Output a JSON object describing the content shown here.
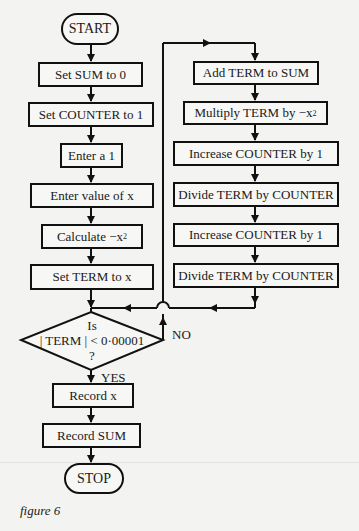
{
  "figure": {
    "caption": "figure 6",
    "colors": {
      "ink": "#111111",
      "paper": "#f3f3f1"
    }
  },
  "nodes": {
    "start": "START",
    "set_sum": "Set SUM to 0",
    "set_counter": "Set COUNTER to 1",
    "enter_a1": "Enter a 1",
    "enter_x": "Enter value of x",
    "calculate": "Calculate −x",
    "calculate_sup": "2",
    "set_term": "Set TERM to x",
    "decision_line1": "Is",
    "decision_line2": "| TERM | < 0·00001",
    "decision_line3": "?",
    "record_x": "Record x",
    "record_sum": "Record SUM",
    "stop": "STOP",
    "add_term": "Add TERM to SUM",
    "multiply": "Multiply TERM by −x",
    "multiply_sup": "2",
    "increase1": "Increase COUNTER by 1",
    "divide1": "Divide TERM by COUNTER",
    "increase2": "Increase COUNTER by 1",
    "divide2": "Divide TERM by COUNTER"
  },
  "branches": {
    "yes": "YES",
    "no": "NO"
  }
}
